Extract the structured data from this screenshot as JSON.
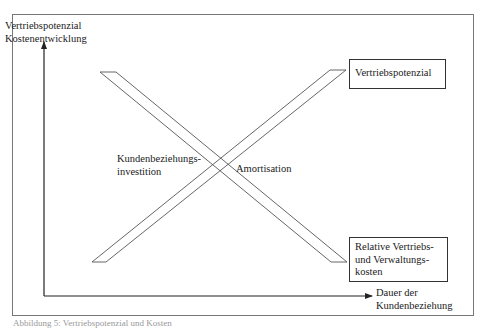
{
  "diagram": {
    "y_axis_label_line1": "Vertriebspotenzial",
    "y_axis_label_line2": "Kostenentwicklung",
    "x_axis_label_line1": "Dauer der",
    "x_axis_label_line2": "Kundenbeziehung",
    "left_label_line1": "Kundenbeziehungs-",
    "left_label_line2": "investition",
    "right_label": "Amortisation",
    "top_box_label": "Vertriebspotenzial",
    "bottom_box_line1": "Relative Vertriebs-",
    "bottom_box_line2": "und Verwaltungs-",
    "bottom_box_line3": "kosten"
  },
  "caption": {
    "text": "Abbildung 5: Vertriebspotenzial und Kosten"
  },
  "colors": {
    "line": "#555555",
    "frame": "#777777",
    "text": "#222222"
  }
}
